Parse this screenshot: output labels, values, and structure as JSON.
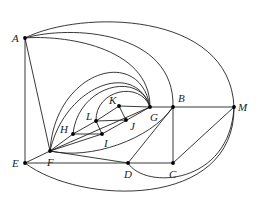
{
  "figure": {
    "type": "graph-diagram",
    "nodes": [
      {
        "id": "A",
        "label": "A",
        "x": 25,
        "y": 38,
        "lx": 12,
        "ly": 42
      },
      {
        "id": "E",
        "label": "E",
        "x": 25,
        "y": 163,
        "lx": 12,
        "ly": 167
      },
      {
        "id": "F",
        "label": "F",
        "x": 50,
        "y": 151,
        "lx": 47,
        "ly": 166
      },
      {
        "id": "H",
        "label": "H",
        "x": 73,
        "y": 134,
        "lx": 60,
        "ly": 133
      },
      {
        "id": "L",
        "label": "L",
        "x": 96,
        "y": 121,
        "lx": 86,
        "ly": 120
      },
      {
        "id": "K",
        "label": "K",
        "x": 119,
        "y": 106,
        "lx": 109,
        "ly": 104
      },
      {
        "id": "I",
        "label": "I",
        "x": 102,
        "y": 134,
        "lx": 104,
        "ly": 147
      },
      {
        "id": "J",
        "label": "J",
        "x": 126,
        "y": 120,
        "lx": 130,
        "ly": 130
      },
      {
        "id": "G",
        "label": "G",
        "x": 150,
        "y": 107,
        "lx": 150,
        "ly": 121
      },
      {
        "id": "B",
        "label": "B",
        "x": 173,
        "y": 107,
        "lx": 178,
        "ly": 102
      },
      {
        "id": "M",
        "label": "M",
        "x": 234,
        "y": 107,
        "lx": 238,
        "ly": 111
      },
      {
        "id": "D",
        "label": "D",
        "x": 128,
        "y": 163,
        "lx": 124,
        "ly": 178
      },
      {
        "id": "C",
        "label": "C",
        "x": 173,
        "y": 163,
        "lx": 169,
        "ly": 178
      }
    ],
    "edges": [
      {
        "from": "A",
        "to": "E",
        "d": "M25,38 L25,163"
      },
      {
        "from": "A",
        "to": "F",
        "d": "M25,38 L50,151"
      },
      {
        "from": "A",
        "to": "M",
        "d": "M25,38 C80,10 230,10 234,107"
      },
      {
        "from": "A",
        "to": "B",
        "d": "M25,38 C70,25 175,30 173,107"
      },
      {
        "from": "A",
        "to": "G",
        "d": "M25,38 C60,35 150,45 150,107"
      },
      {
        "from": "E",
        "to": "F",
        "d": "M25,163 L50,151"
      },
      {
        "from": "E",
        "to": "D",
        "d": "M25,163 L128,163"
      },
      {
        "from": "E",
        "to": "M",
        "d": "M25,163 C80,205 235,210 234,107"
      },
      {
        "from": "F",
        "to": "D",
        "d": "M50,151 L128,163"
      },
      {
        "from": "F",
        "to": "H",
        "d": "M50,151 L73,134"
      },
      {
        "from": "F",
        "to": "I",
        "d": "M50,151 L102,134"
      },
      {
        "from": "F",
        "to": "G-line",
        "d": "M50,151 L150,107"
      },
      {
        "from": "F",
        "to": "G-arc1",
        "d": "M50,151 C55,70 140,45 150,107"
      },
      {
        "from": "F",
        "to": "G-arc2",
        "d": "M50,151 C65,85 135,60 150,107"
      },
      {
        "from": "F",
        "to": "B",
        "d": "M50,151 C90,160 150,140 173,107"
      },
      {
        "from": "H",
        "to": "G-arc",
        "d": "M73,134 C78,85 140,70 150,107"
      },
      {
        "from": "L",
        "to": "G-arc",
        "d": "M96,121 C95,90 140,80 150,107"
      },
      {
        "from": "H",
        "to": "L",
        "d": "M73,134 L96,121"
      },
      {
        "from": "H",
        "to": "I",
        "d": "M73,134 L102,134"
      },
      {
        "from": "L",
        "to": "K",
        "d": "M96,121 L119,106"
      },
      {
        "from": "L",
        "to": "J",
        "d": "M96,121 L126,120"
      },
      {
        "from": "L",
        "to": "I",
        "d": "M96,121 L102,134"
      },
      {
        "from": "K",
        "to": "J",
        "d": "M119,106 L126,120"
      },
      {
        "from": "K",
        "to": "G",
        "d": "M119,106 L150,107"
      },
      {
        "from": "I",
        "to": "G",
        "d": "M102,134 L150,107"
      },
      {
        "from": "G",
        "to": "B",
        "d": "M150,107 L173,107"
      },
      {
        "from": "B",
        "to": "M",
        "d": "M173,107 L234,107"
      },
      {
        "from": "B",
        "to": "C",
        "d": "M173,107 L173,163"
      },
      {
        "from": "B",
        "to": "D",
        "d": "M173,107 L128,163"
      },
      {
        "from": "C",
        "to": "D",
        "d": "M128,163 L173,163"
      },
      {
        "from": "C",
        "to": "M",
        "d": "M173,163 L234,107"
      },
      {
        "from": "D",
        "to": "M",
        "d": "M128,163 C145,190 230,185 234,107"
      }
    ]
  }
}
